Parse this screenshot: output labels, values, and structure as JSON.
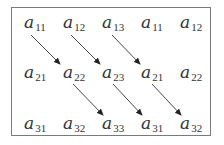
{
  "diagram": {
    "type": "matrix-diagonal-scheme",
    "rows": [
      [
        {
          "base": "a",
          "sub": "11"
        },
        {
          "base": "a",
          "sub": "12"
        },
        {
          "base": "a",
          "sub": "13"
        },
        {
          "base": "a",
          "sub": "11"
        },
        {
          "base": "a",
          "sub": "12"
        }
      ],
      [
        {
          "base": "a",
          "sub": "21"
        },
        {
          "base": "a",
          "sub": "22"
        },
        {
          "base": "a",
          "sub": "23"
        },
        {
          "base": "a",
          "sub": "21"
        },
        {
          "base": "a",
          "sub": "22"
        }
      ],
      [
        {
          "base": "a",
          "sub": "31"
        },
        {
          "base": "a",
          "sub": "32"
        },
        {
          "base": "a",
          "sub": "33"
        },
        {
          "base": "a",
          "sub": "31"
        },
        {
          "base": "a",
          "sub": "32"
        }
      ]
    ],
    "arrows": [
      {
        "from": "a11 (r1,c1)",
        "to": "a22 (r2,c2)"
      },
      {
        "from": "a12 (r1,c2)",
        "to": "a23 (r2,c3)"
      },
      {
        "from": "a13 (r1,c3)",
        "to": "a21 (r2,c4)"
      },
      {
        "from": "a22 (r2,c2)",
        "to": "a33 (r3,c3)"
      },
      {
        "from": "a23 (r2,c3)",
        "to": "a31 (r3,c4)"
      },
      {
        "from": "a21 (r2,c4)",
        "to": "a32 (r3,c5)"
      }
    ],
    "colors": {
      "text": "#333333",
      "border": "#7a7a7a",
      "arrow": "#222222"
    }
  }
}
